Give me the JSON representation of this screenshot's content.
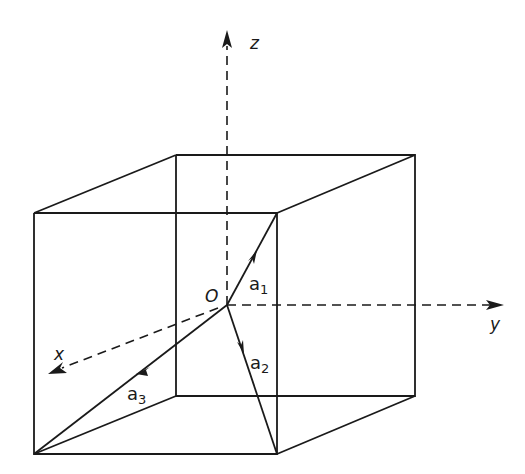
{
  "figure": {
    "axes": {
      "x": {
        "label": "x"
      },
      "y": {
        "label": "y"
      },
      "z": {
        "label": "z"
      }
    },
    "origin": {
      "label": "O"
    },
    "vectors": [
      {
        "name": "a",
        "subscript": "1"
      },
      {
        "name": "a",
        "subscript": "2"
      },
      {
        "name": "a",
        "subscript": "3"
      }
    ],
    "colors": {
      "ink": "#1a1a1a",
      "background": "#ffffff"
    }
  }
}
